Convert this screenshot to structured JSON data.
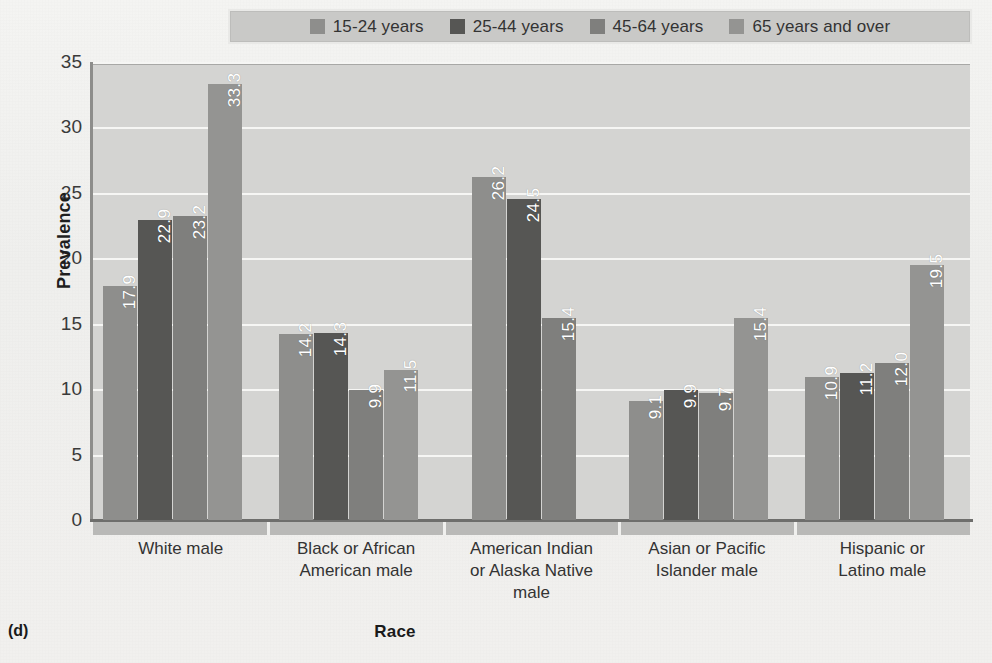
{
  "figure": {
    "panel_id": "(d)",
    "xtitle": "Race",
    "ytitle": "Prevalence"
  },
  "legend": {
    "items": [
      {
        "label": "15-24 years",
        "color": "#8e8e8c"
      },
      {
        "label": "25-44 years",
        "color": "#565654"
      },
      {
        "label": "45-64 years",
        "color": "#7f7f7d"
      },
      {
        "label": "65 years and over",
        "color": "#949492"
      }
    ]
  },
  "yaxis": {
    "ticks": [
      "0",
      "5",
      "10",
      "15",
      "20",
      "25",
      "30",
      "35"
    ]
  },
  "chart_data": {
    "type": "bar",
    "title": "",
    "xlabel": "Race",
    "ylabel": "Prevalence",
    "ylim": [
      0,
      35
    ],
    "yticks": [
      0,
      5,
      10,
      15,
      20,
      25,
      30,
      35
    ],
    "grid": true,
    "legend_position": "top",
    "categories": [
      "White male",
      "Black or African American male",
      "American Indian or Alaska Native male",
      "Asian or Pacific Islander male",
      "Hispanic or Latino male"
    ],
    "series": [
      {
        "name": "15-24 years",
        "color": "#8e8e8c",
        "values": [
          17.9,
          14.2,
          26.2,
          9.1,
          10.9
        ]
      },
      {
        "name": "25-44 years",
        "color": "#565654",
        "values": [
          22.9,
          14.3,
          24.5,
          9.9,
          11.2
        ]
      },
      {
        "name": "45-64 years",
        "color": "#7f7f7d",
        "values": [
          23.2,
          9.9,
          15.4,
          9.7,
          12.0
        ]
      },
      {
        "name": "65 years and over",
        "color": "#949492",
        "values": [
          33.3,
          11.5,
          null,
          15.4,
          19.5
        ]
      }
    ],
    "bar_labels": [
      [
        "17.9",
        "22.9",
        "23.2",
        "33.3"
      ],
      [
        "14.2",
        "14.3",
        "9.9",
        "11.5"
      ],
      [
        "26.2",
        "24.5",
        "15.4",
        ""
      ],
      [
        "9.1",
        "9.9",
        "9.7",
        "15.4"
      ],
      [
        "10.9",
        "11.2",
        "12.0",
        "19.5"
      ]
    ]
  },
  "xlabels": [
    [
      "White male"
    ],
    [
      "Black or African",
      "American male"
    ],
    [
      "American Indian",
      "or Alaska Native",
      "male"
    ],
    [
      "Asian or Pacific",
      "Islander male"
    ],
    [
      "Hispanic or",
      "Latino male"
    ]
  ]
}
